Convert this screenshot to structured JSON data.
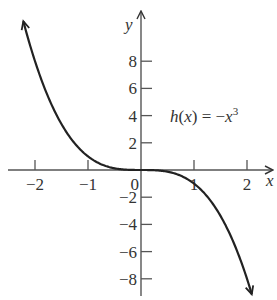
{
  "chart_data": {
    "type": "line",
    "title": "",
    "function": "h(x) = -x^3",
    "annotation": {
      "text_prefix": "h",
      "text_arg": "(x)",
      "text_eq": " = −",
      "text_var": "x",
      "text_exp": "3"
    },
    "xlabel": "x",
    "ylabel": "y",
    "xlim": [
      -2.5,
      2.5
    ],
    "ylim": [
      -9.5,
      11.5
    ],
    "x_ticks": [
      -2,
      -1,
      0,
      1,
      2
    ],
    "x_tick_labels": [
      "−2",
      "−1",
      "0",
      "1",
      "2"
    ],
    "y_ticks": [
      -8,
      -6,
      -4,
      -2,
      2,
      4,
      6,
      8
    ],
    "y_tick_labels": [
      "−8",
      "−6",
      "−4",
      "−2",
      "2",
      "4",
      "6",
      "8"
    ],
    "grid": false,
    "legend": "none",
    "series": [
      {
        "name": "h(x) = -x^3",
        "x": [
          -2.2,
          -2,
          -1.5,
          -1,
          -0.5,
          0,
          0.5,
          1,
          1.5,
          2,
          2.1
        ],
        "values": [
          10.65,
          8,
          3.375,
          1,
          0.125,
          0,
          -0.125,
          -1,
          -3.375,
          -8,
          -9.26
        ]
      }
    ],
    "colors": {
      "axis": "#555555",
      "curve": "#222222",
      "text": "#333333"
    }
  }
}
